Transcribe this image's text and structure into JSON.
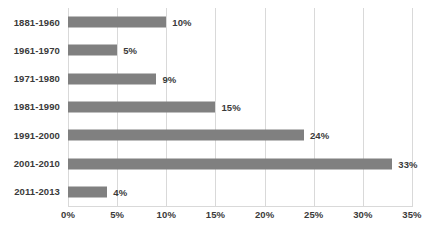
{
  "chart_data": {
    "type": "bar",
    "orientation": "horizontal",
    "title": "",
    "subtitle": "",
    "xlabel": "",
    "ylabel": "",
    "categories": [
      "1881-1960",
      "1961-1970",
      "1971-1980",
      "1981-1990",
      "1991-2000",
      "2001-2010",
      "2011-2013"
    ],
    "values": [
      10,
      5,
      9,
      15,
      24,
      33,
      4
    ],
    "data_labels": [
      "10%",
      "5%",
      "9%",
      "15%",
      "24%",
      "33%",
      "4%"
    ],
    "xlim": [
      0,
      35
    ],
    "xticks": [
      0,
      5,
      10,
      15,
      20,
      25,
      30,
      35
    ],
    "xtick_labels": [
      "0%",
      "5%",
      "10%",
      "15%",
      "20%",
      "25%",
      "30%",
      "35%"
    ],
    "grid": true,
    "grid_axis": "x",
    "legend": false,
    "legend_position": "none",
    "series": [
      {
        "name": "",
        "values": [
          10,
          5,
          9,
          15,
          24,
          33,
          4
        ]
      }
    ]
  },
  "colors": {
    "background": "#ffffff",
    "bar": "#808080",
    "gridline": "#d9d9d9",
    "text": "#3a3a3a"
  }
}
